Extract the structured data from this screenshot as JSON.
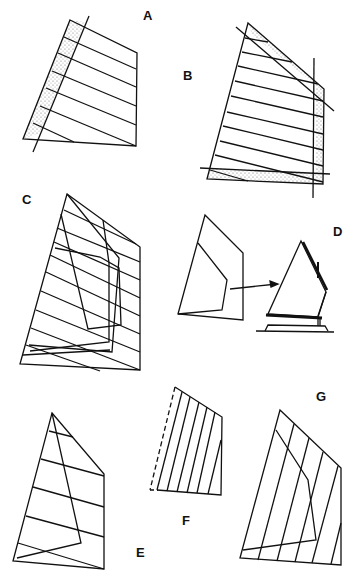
{
  "figure": {
    "line_color": "#111111",
    "shade_color": "#c9c9c9"
  },
  "labels": {
    "a": "A",
    "b": "B",
    "c": "C",
    "d": "D",
    "e": "E",
    "f": "F",
    "g": "G"
  },
  "panels": [
    {
      "id": "A",
      "caption": "A"
    },
    {
      "id": "B",
      "caption": "B"
    },
    {
      "id": "C",
      "caption": "C"
    },
    {
      "id": "D",
      "caption": "D"
    },
    {
      "id": "E",
      "caption": "E"
    },
    {
      "id": "F",
      "caption": "F"
    },
    {
      "id": "G",
      "caption": "G"
    }
  ]
}
